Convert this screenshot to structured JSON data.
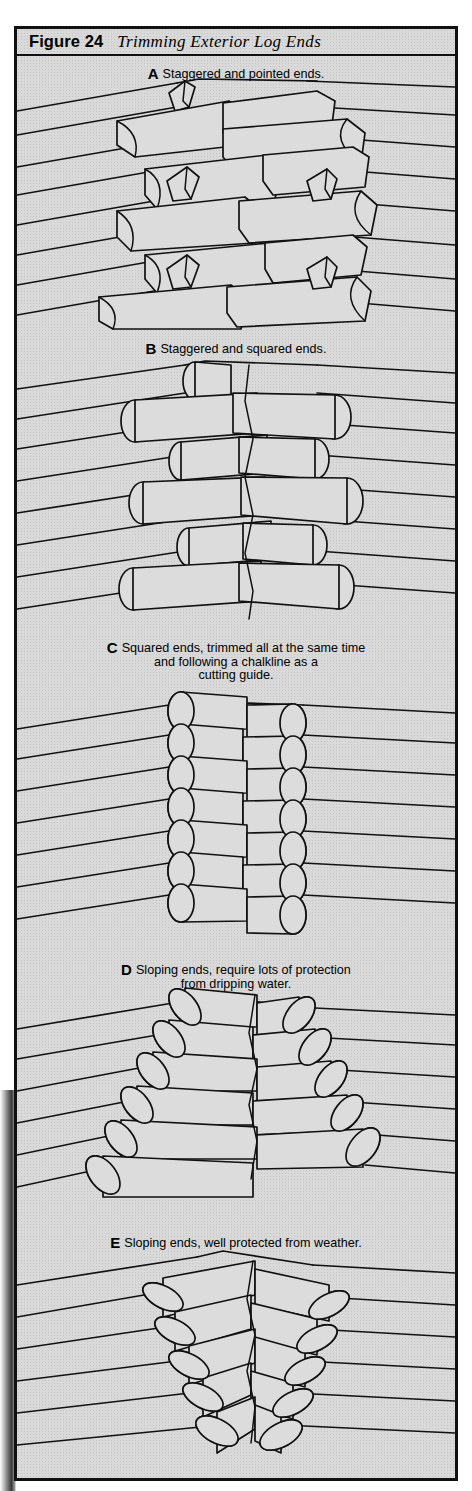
{
  "figure": {
    "number_label": "Figure 24",
    "title": "Trimming Exterior Log Ends",
    "background_color": "#d9d9d9",
    "line_color": "#111111"
  },
  "panels": [
    {
      "letter": "A",
      "caption_lines": [
        "Staggered and pointed ends."
      ],
      "description": "Log corner notch with staggered, pointed (wedge-cut) log ends"
    },
    {
      "letter": "B",
      "caption_lines": [
        "Staggered and squared ends."
      ],
      "description": "Log corner notch with staggered, squared (flat-cut) log ends"
    },
    {
      "letter": "C",
      "caption_lines": [
        "Squared ends, trimmed all at the same time",
        "and following a chalkline as a",
        "cutting guide."
      ],
      "description": "Log corner with all ends flush and aligned vertically"
    },
    {
      "letter": "D",
      "caption_lines": [
        "Sloping ends, require lots of protection",
        "from dripping water."
      ],
      "description": "Log corner with ends cut on an outward downward slope"
    },
    {
      "letter": "E",
      "caption_lines": [
        "Sloping ends, well protected from weather."
      ],
      "description": "Log corner with ends cut on an inward slope tucked under"
    }
  ]
}
